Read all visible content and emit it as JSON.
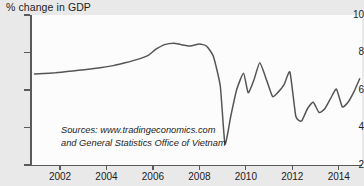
{
  "chart_data": {
    "type": "line",
    "title": "% change in GDP",
    "xlabel": "",
    "ylabel": "% change in GDP",
    "ylim": [
      2,
      10
    ],
    "xlim": [
      2000.75,
      2015.0
    ],
    "grid": false,
    "legend": "none",
    "line_color": "#555555",
    "series": [
      {
        "name": "Vietnam GDP annual growth rate",
        "x": [
          2000.9,
          2001.3,
          2001.8,
          2002.3,
          2002.8,
          2003.3,
          2003.8,
          2004.3,
          2004.8,
          2005.3,
          2005.8,
          2006.1,
          2006.5,
          2006.9,
          2007.2,
          2007.6,
          2008.0,
          2008.3,
          2008.6,
          2008.9,
          2009.1,
          2009.35,
          2009.6,
          2009.9,
          2010.1,
          2010.35,
          2010.6,
          2010.9,
          2011.15,
          2011.4,
          2011.65,
          2011.9,
          2012.15,
          2012.4,
          2012.65,
          2012.9,
          2013.15,
          2013.4,
          2013.65,
          2013.9,
          2014.15,
          2014.4,
          2014.65,
          2014.9
        ],
        "values": [
          6.85,
          6.88,
          6.92,
          6.98,
          7.05,
          7.12,
          7.2,
          7.3,
          7.45,
          7.62,
          7.85,
          8.15,
          8.42,
          8.5,
          8.42,
          8.35,
          8.45,
          8.35,
          7.8,
          6.2,
          3.12,
          4.6,
          6.0,
          6.9,
          5.85,
          6.55,
          7.45,
          6.5,
          5.65,
          5.9,
          6.3,
          6.95,
          4.6,
          4.35,
          5.0,
          5.35,
          4.8,
          5.0,
          5.55,
          6.05,
          5.1,
          5.35,
          5.9,
          6.6
        ]
      }
    ],
    "y_ticks": [
      {
        "value": 10,
        "label": "10"
      },
      {
        "value": 8,
        "label": "8"
      },
      {
        "value": 6,
        "label": "6"
      },
      {
        "value": 4,
        "label": "4"
      },
      {
        "value": 2,
        "label": "2"
      }
    ],
    "x_ticks": [
      {
        "value": 2002,
        "label": "2002"
      },
      {
        "value": 2004,
        "label": "2004"
      },
      {
        "value": 2006,
        "label": "2006"
      },
      {
        "value": 2008,
        "label": "2008"
      },
      {
        "value": 2010,
        "label": "2010"
      },
      {
        "value": 2012,
        "label": "2012"
      },
      {
        "value": 2014,
        "label": "2014"
      }
    ],
    "annotations": {
      "source_line_1": "Sources: www.tradingeconomics.com",
      "source_line_2": "and General Statistics Office of Vietnam"
    }
  },
  "colors": {
    "page_background": "#e9e9e9",
    "plot_background": "#fcfcfc",
    "axis": "#5a5a5a",
    "text": "#1c1c1c",
    "line": "#555555"
  }
}
